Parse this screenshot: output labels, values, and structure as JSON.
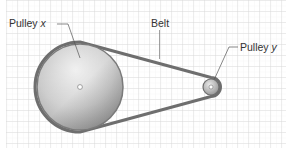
{
  "diagram": {
    "title": "",
    "labels": {
      "pulley_x": {
        "text": "Pulley ",
        "var": "x"
      },
      "belt": {
        "text": "Belt"
      },
      "pulley_y": {
        "text": "Pulley ",
        "var": "y"
      }
    },
    "colors": {
      "background": "#ffffff",
      "grid_major": "#d2d2d2",
      "grid_minor": "#e8e8e8",
      "belt": "#6e6e6e",
      "pulley_light": "#e6e6e6",
      "pulley_dark": "#8a8a8a",
      "pulley_rim": "#7a7a7a",
      "leader_line": "#555555",
      "label_text": "#333333"
    },
    "geometry": {
      "grid": {
        "x": 6,
        "y": 0,
        "width": 280,
        "height": 148,
        "major": 11
      },
      "pulley_x": {
        "cx": 80,
        "cy": 87,
        "r": 43
      },
      "pulley_y": {
        "cx": 211,
        "cy": 87,
        "r": 8
      }
    }
  }
}
